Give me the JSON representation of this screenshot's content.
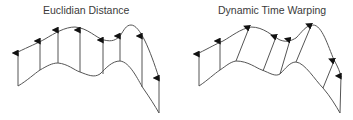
{
  "panels": [
    {
      "title": "Euclidian Distance",
      "top_curve": "M18,52 C28,47 38,43 45,39 C55,33 65,27 75,27 C88,28 96,38 104,40 C112,42 116,40 120,36 C124,30 126,25 131,25 C140,25 150,50 159,78",
      "bottom_curve": "M18,86 L18,86 C28,80 34,74 40,70 C47,66 52,63 58,63 C68,64 74,70 80,72 C88,75 94,78 100,74 C106,68 112,61 120,61 C130,62 138,80 143,88 C150,98 155,106 159,113",
      "left_edge": [
        [
          18,
          86
        ],
        [
          18,
          52
        ]
      ],
      "arrows": [
        {
          "x1": 18,
          "y1": 86,
          "x2": 18,
          "y2": 53
        },
        {
          "x1": 40,
          "y1": 70,
          "x2": 40,
          "y2": 41
        },
        {
          "x1": 58,
          "y1": 63,
          "x2": 58,
          "y2": 30
        },
        {
          "x1": 80,
          "y1": 72,
          "x2": 80,
          "y2": 30
        },
        {
          "x1": 103,
          "y1": 74,
          "x2": 103,
          "y2": 40
        },
        {
          "x1": 120,
          "y1": 61,
          "x2": 120,
          "y2": 36
        },
        {
          "x1": 142,
          "y1": 87,
          "x2": 142,
          "y2": 36
        },
        {
          "x1": 159,
          "y1": 113,
          "x2": 159,
          "y2": 78
        }
      ]
    },
    {
      "title": "Dynamic Time Warping",
      "top_curve": "M199,53 C209,48 216,44 223,41 C232,36 240,29 251,27 C264,27 272,36 280,40 C288,43 292,40 296,38 C302,32 306,25 313,25 C322,25 328,46 334,60 C338,67 340,72 341,77",
      "bottom_curve": "M199,86 C208,80 214,74 220,70 C226,66 230,62 236,61 C248,61 256,68 262,70 C270,73 275,77 280,74 C286,68 290,62 296,62 C305,63 315,80 323,88 C330,96 336,106 340,113",
      "left_edge": [
        [
          199,
          86
        ],
        [
          199,
          53
        ]
      ],
      "arrows": [
        {
          "x1": 199,
          "y1": 86,
          "x2": 199,
          "y2": 54
        },
        {
          "x1": 220,
          "y1": 70,
          "x2": 220,
          "y2": 41
        },
        {
          "x1": 236,
          "y1": 61,
          "x2": 249,
          "y2": 28
        },
        {
          "x1": 263,
          "y1": 71,
          "x2": 276,
          "y2": 37
        },
        {
          "x1": 280,
          "y1": 74,
          "x2": 290,
          "y2": 40
        },
        {
          "x1": 296,
          "y1": 62,
          "x2": 311,
          "y2": 26
        },
        {
          "x1": 323,
          "y1": 88,
          "x2": 334,
          "y2": 61
        },
        {
          "x1": 340,
          "y1": 113,
          "x2": 341,
          "y2": 76
        }
      ]
    }
  ],
  "colors": {
    "stroke": "#555555",
    "arrowhead": "#111111",
    "text": "#3a3a3a"
  }
}
